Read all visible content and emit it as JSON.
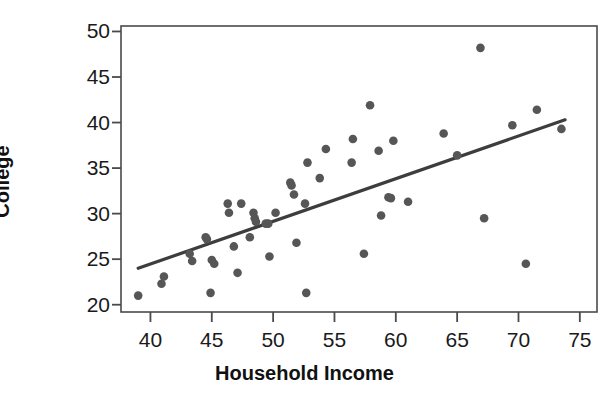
{
  "chart_data": {
    "type": "scatter",
    "title": "",
    "xlabel": "Household Income",
    "ylabel": "College",
    "xlim": [
      37.6,
      76.4
    ],
    "ylim": [
      19.2,
      50.6
    ],
    "xticks": [
      40,
      45,
      50,
      55,
      60,
      65,
      70,
      75
    ],
    "yticks": [
      20,
      25,
      30,
      35,
      40,
      45,
      50
    ],
    "grid": false,
    "legend": null,
    "marker_color": "#565656",
    "line_color": "#3d3d3d",
    "axis_color": "#4a4a4a",
    "points": [
      {
        "x": 39.0,
        "y": 21.0
      },
      {
        "x": 40.9,
        "y": 22.3
      },
      {
        "x": 41.1,
        "y": 23.1
      },
      {
        "x": 43.2,
        "y": 25.6
      },
      {
        "x": 43.4,
        "y": 24.8
      },
      {
        "x": 44.5,
        "y": 27.4
      },
      {
        "x": 44.6,
        "y": 27.2
      },
      {
        "x": 44.9,
        "y": 21.3
      },
      {
        "x": 45.0,
        "y": 24.9
      },
      {
        "x": 45.2,
        "y": 24.5
      },
      {
        "x": 46.3,
        "y": 31.1
      },
      {
        "x": 46.4,
        "y": 30.1
      },
      {
        "x": 46.8,
        "y": 26.4
      },
      {
        "x": 47.4,
        "y": 31.1
      },
      {
        "x": 47.1,
        "y": 23.5
      },
      {
        "x": 48.1,
        "y": 27.4
      },
      {
        "x": 48.4,
        "y": 30.1
      },
      {
        "x": 48.5,
        "y": 29.5
      },
      {
        "x": 48.6,
        "y": 29.1
      },
      {
        "x": 49.4,
        "y": 28.9
      },
      {
        "x": 49.6,
        "y": 28.9
      },
      {
        "x": 49.7,
        "y": 25.3
      },
      {
        "x": 50.2,
        "y": 30.1
      },
      {
        "x": 51.4,
        "y": 33.4
      },
      {
        "x": 51.5,
        "y": 33.1
      },
      {
        "x": 51.7,
        "y": 32.1
      },
      {
        "x": 51.9,
        "y": 26.8
      },
      {
        "x": 52.6,
        "y": 31.1
      },
      {
        "x": 52.7,
        "y": 21.3
      },
      {
        "x": 52.8,
        "y": 35.6
      },
      {
        "x": 53.8,
        "y": 33.9
      },
      {
        "x": 54.3,
        "y": 37.1
      },
      {
        "x": 56.4,
        "y": 35.6
      },
      {
        "x": 56.5,
        "y": 38.2
      },
      {
        "x": 57.4,
        "y": 25.6
      },
      {
        "x": 57.9,
        "y": 41.9
      },
      {
        "x": 58.6,
        "y": 36.9
      },
      {
        "x": 58.8,
        "y": 29.8
      },
      {
        "x": 59.4,
        "y": 31.8
      },
      {
        "x": 59.6,
        "y": 31.7
      },
      {
        "x": 59.8,
        "y": 38.0
      },
      {
        "x": 61.0,
        "y": 31.3
      },
      {
        "x": 63.9,
        "y": 38.8
      },
      {
        "x": 65.0,
        "y": 36.4
      },
      {
        "x": 66.9,
        "y": 48.2
      },
      {
        "x": 67.2,
        "y": 29.5
      },
      {
        "x": 69.5,
        "y": 39.7
      },
      {
        "x": 70.6,
        "y": 24.5
      },
      {
        "x": 71.5,
        "y": 41.4
      },
      {
        "x": 73.5,
        "y": 39.3
      }
    ],
    "trendline": {
      "x_start": 39.0,
      "y_start": 24.0,
      "x_end": 73.8,
      "y_end": 40.3
    }
  }
}
